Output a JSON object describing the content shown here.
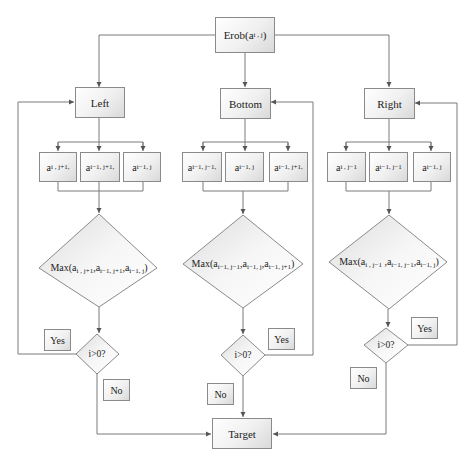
{
  "diagram": {
    "start": {
      "label": "Erob(a",
      "sub": "i , j",
      "close": ")"
    },
    "branches": [
      {
        "name": "Left",
        "label": "Left",
        "neighbors": [
          {
            "base": "a",
            "sub": "i , j+1,"
          },
          {
            "base": "a",
            "sub": "i−1, j+1,"
          },
          {
            "base": "a",
            "sub": "i−1, j"
          }
        ],
        "max": {
          "prefix": "Max(a",
          "sub1": "i , j+1",
          "mid1": ",a",
          "sub2": "i−1, j+1",
          "mid2": ",a",
          "sub3": "i−1, j",
          "close": ")"
        },
        "condition": "i>0?",
        "yes": "Yes",
        "no": "No"
      },
      {
        "name": "Bottom",
        "label": "Bottom",
        "neighbors": [
          {
            "base": "a",
            "sub": "i−1, j−1,"
          },
          {
            "base": "a",
            "sub": "i−1, j"
          },
          {
            "base": "a",
            "sub": "i−1, j+1,"
          }
        ],
        "max": {
          "prefix": "Max(a",
          "sub1": "i−1, j−1",
          "mid1": ",a",
          "sub2": "i−1, j",
          "mid2": ",a",
          "sub3": "i−1, j+1",
          "close": ")"
        },
        "condition": "i>0?",
        "yes": "Yes",
        "no": "No"
      },
      {
        "name": "Right",
        "label": "Right",
        "neighbors": [
          {
            "base": "a",
            "sub": "i , j−1"
          },
          {
            "base": "a",
            "sub": "i−1, j−1"
          },
          {
            "base": "a",
            "sub": "i−1, j"
          }
        ],
        "max": {
          "prefix": "Max(a",
          "sub1": "i , j−1",
          "mid1": " ,a",
          "sub2": "i−1, j−1",
          "mid2": ",a",
          "sub3": "i−1, j",
          "close": ")"
        },
        "condition": "i>0?",
        "yes": "Yes",
        "no": "No"
      }
    ],
    "end": {
      "label": "Target"
    }
  },
  "colors": {
    "stroke": "#8a8a8a",
    "line": "#7a7a7a",
    "text": "#222222"
  }
}
